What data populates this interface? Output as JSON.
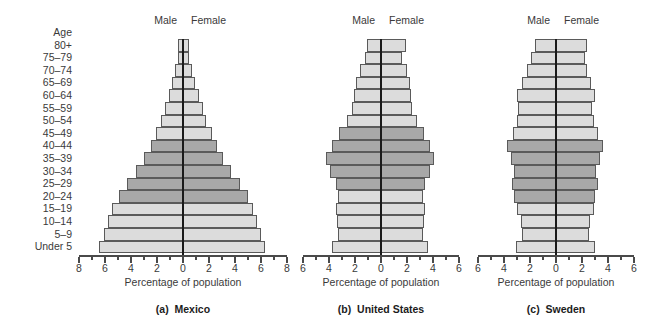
{
  "chart_data": {
    "type": "bar",
    "chart_kind": "population-pyramid",
    "grid": false,
    "legend_position": "none",
    "xlabel": "Percentage of population",
    "ylabel": "Age",
    "age_axis_title": "Age",
    "categories": [
      "Under 5",
      "5–9",
      "10–14",
      "15–19",
      "20–24",
      "25–29",
      "30–34",
      "35–39",
      "40–44",
      "45–49",
      "50–54",
      "55–59",
      "60–64",
      "65–69",
      "70–74",
      "75–79",
      "80+"
    ],
    "side_labels": {
      "left": "Male",
      "right": "Female"
    },
    "shade_colors": {
      "light": "#dcdcdc",
      "dark": "#a8a8a8",
      "outline": "#5a5a5a",
      "centerline": "#1a1a1a"
    },
    "panels": [
      {
        "id": "mexico",
        "caption_letter": "(a)",
        "caption": "Mexico",
        "xlabel": "Percentage of population",
        "xlim": [
          -8,
          8
        ],
        "major_ticks": [
          8,
          6,
          4,
          2,
          0,
          2,
          4,
          6,
          8
        ],
        "tick_step": 2,
        "minor_step": 1,
        "series": [
          {
            "name": "Male",
            "values": [
              6.5,
              6.1,
              5.8,
              5.5,
              4.9,
              4.3,
              3.6,
              3.0,
              2.5,
              2.1,
              1.7,
              1.4,
              1.1,
              0.85,
              0.6,
              0.4,
              0.35
            ]
          },
          {
            "name": "Female",
            "values": [
              6.3,
              6.0,
              5.7,
              5.4,
              5.0,
              4.4,
              3.7,
              3.1,
              2.6,
              2.2,
              1.8,
              1.5,
              1.2,
              0.95,
              0.7,
              0.45,
              0.45
            ]
          }
        ],
        "dark_rows": [
          4,
          5,
          6,
          7,
          8
        ]
      },
      {
        "id": "united-states",
        "caption_letter": "(b)",
        "caption": "United States",
        "xlabel": "Percentage of population",
        "xlim": [
          -6,
          6
        ],
        "major_ticks": [
          6,
          4,
          2,
          0,
          2,
          4,
          6
        ],
        "tick_step": 2,
        "minor_step": 1,
        "series": [
          {
            "name": "Male",
            "values": [
              3.8,
              3.3,
              3.4,
              3.5,
              3.3,
              3.5,
              3.9,
              4.2,
              3.8,
              3.2,
              2.6,
              2.2,
              2.1,
              1.9,
              1.6,
              1.2,
              1.1
            ]
          },
          {
            "name": "Female",
            "values": [
              3.6,
              3.2,
              3.3,
              3.4,
              3.2,
              3.4,
              3.8,
              4.1,
              3.8,
              3.3,
              2.8,
              2.4,
              2.3,
              2.2,
              2.0,
              1.6,
              1.9
            ]
          }
        ],
        "dark_rows": [
          5,
          6,
          7,
          8,
          9
        ]
      },
      {
        "id": "sweden",
        "caption_letter": "(c)",
        "caption": "Sweden",
        "xlabel": "Percentage of population",
        "xlim": [
          -6,
          6
        ],
        "major_ticks": [
          6,
          4,
          2,
          0,
          2,
          4,
          6
        ],
        "tick_step": 2,
        "minor_step": 1,
        "series": [
          {
            "name": "Male",
            "values": [
              3.1,
              2.6,
              2.7,
              3.0,
              3.2,
              3.4,
              3.2,
              3.5,
              3.8,
              3.3,
              3.0,
              2.9,
              3.0,
              2.6,
              2.2,
              1.9,
              1.6
            ]
          },
          {
            "name": "Female",
            "values": [
              3.0,
              2.5,
              2.6,
              2.9,
              3.0,
              3.2,
              3.1,
              3.4,
              3.6,
              3.2,
              2.9,
              2.8,
              3.0,
              2.7,
              2.4,
              2.2,
              2.4
            ]
          }
        ],
        "dark_rows": [
          4,
          5,
          6,
          7,
          8
        ]
      }
    ]
  }
}
